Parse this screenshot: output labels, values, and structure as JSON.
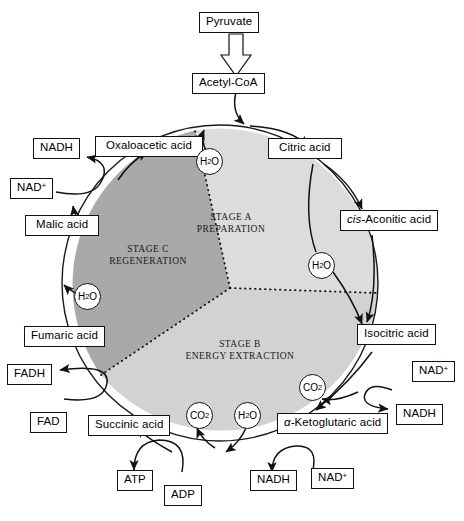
{
  "diagram": {
    "colors": {
      "stage_a_fill": "#dcdcdc",
      "stage_b_fill": "#d2d2d2",
      "stage_c_fill": "#a9a9a9",
      "outline": "#1a1a1a",
      "background": "#ffffff"
    }
  },
  "stages": [
    {
      "id": "stage-a",
      "line1": "STAGE A",
      "line2": "PREPARATION"
    },
    {
      "id": "stage-b",
      "line1": "STAGE B",
      "line2": "ENERGY EXTRACTION"
    },
    {
      "id": "stage-c",
      "line1": "STAGE C",
      "line2": "REGENERATION"
    }
  ],
  "nodes": {
    "pyruvate": "Pyruvate",
    "acetyl_coa": "Acetyl-CoA",
    "oxaloacetic": "Oxaloacetic acid",
    "citric": "Citric acid",
    "cis_aconitic_prefix": "cis-",
    "cis_aconitic_rest": "Aconitic acid",
    "isocitric": "Isocitric acid",
    "ketoglutaric_prefix": "α-",
    "ketoglutaric_rest": "Ketoglutaric acid",
    "succinic": "Succinic acid",
    "fumaric": "Fumaric acid",
    "malic": "Malic acid"
  },
  "cofactors": {
    "nadh_top": "NADH",
    "nad_top": "NAD",
    "nad_top_charge": "+",
    "fadh": "FADH",
    "fad": "FAD",
    "atp": "ATP",
    "adp": "ADP",
    "nadh_bottom": "NADH",
    "nad_bottom": "NAD",
    "nad_bottom_charge": "+",
    "nad_right_upper": "NAD",
    "nad_right_upper_charge": "+",
    "nadh_right": "NADH"
  },
  "small_molecules": {
    "water_top": "H",
    "water_top_sub": "2",
    "water_top_end": "O",
    "water_right": "H",
    "water_right_sub": "2",
    "water_right_end": "O",
    "water_left": "H",
    "water_left_sub": "2",
    "water_left_end": "O",
    "water_bottom": "H",
    "water_bottom_sub": "2",
    "water_bottom_end": "O",
    "co2_right": "CO",
    "co2_right_sub": "2",
    "co2_bottom": "CO",
    "co2_bottom_sub": "2"
  }
}
